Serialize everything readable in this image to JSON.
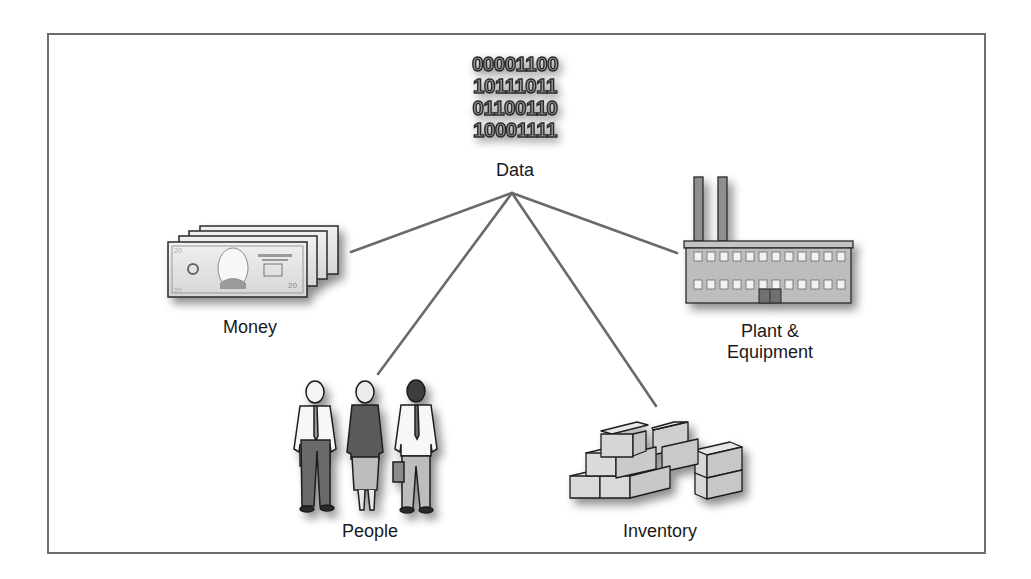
{
  "diagram": {
    "type": "hub-and-spoke",
    "frame": {
      "border_color": "#6e6e6e",
      "background": "#ffffff"
    },
    "line_color": "#6a6a6a",
    "hub": {
      "label": "Data",
      "icon": "binary-data-icon",
      "binary_rows": [
        "00001100",
        "10111011",
        "01100110",
        "10001111"
      ]
    },
    "spokes": [
      {
        "id": "money",
        "label": "Money",
        "icon": "money-stack-icon"
      },
      {
        "id": "people",
        "label": "People",
        "icon": "people-group-icon"
      },
      {
        "id": "inventory",
        "label": "Inventory",
        "icon": "boxes-icon"
      },
      {
        "id": "plant",
        "label_line1": "Plant &",
        "label_line2": "Equipment",
        "icon": "factory-icon"
      }
    ],
    "money_denomination": "20"
  }
}
